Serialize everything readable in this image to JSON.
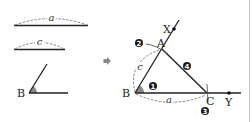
{
  "figure": {
    "given": {
      "segment_a_label": "a",
      "segment_c_label": "c",
      "angle_vertex_label": "B"
    },
    "arrow": "right-arrow",
    "construction": {
      "points": {
        "B": "B",
        "A": "A",
        "C": "C",
        "X": "X",
        "Y": "Y"
      },
      "side_labels": {
        "c": "c",
        "a": "a"
      },
      "steps": [
        "1",
        "2",
        "3",
        "4"
      ]
    },
    "colors": {
      "line": "#222222",
      "dash": "#555555",
      "angle_fill": "#8a8a8a",
      "step_marker": "#1a1a1a",
      "border": "#bbbbbb"
    }
  }
}
